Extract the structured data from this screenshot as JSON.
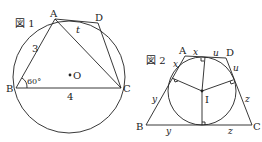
{
  "figure1": {
    "label": "図 1",
    "points": {
      "A": "A",
      "B": "B",
      "C": "C",
      "D": "D",
      "O": "O"
    },
    "side_AB": "3",
    "side_BC": "4",
    "side_AD": "t",
    "angle_B": "60°"
  },
  "figure2": {
    "label": "図 2",
    "points": {
      "A": "A",
      "B": "B",
      "C": "C",
      "D": "D",
      "I": "I"
    },
    "tangent_labels": {
      "AD_left": "x",
      "AD_right": "u",
      "AB_top": "x",
      "AB_bottom": "y",
      "BC_left": "y",
      "BC_right": "z",
      "CD_top": "u",
      "CD_bottom": "z"
    }
  }
}
